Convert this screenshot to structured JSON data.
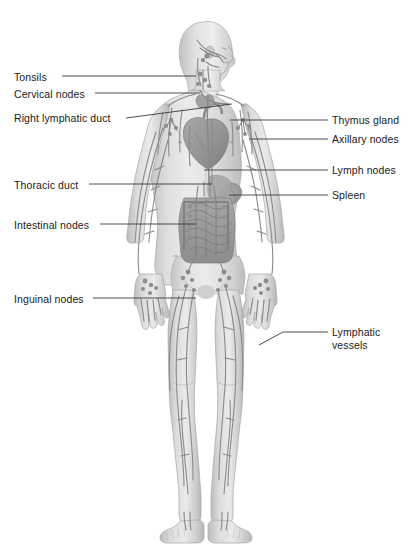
{
  "diagram": {
    "background_color": "#ffffff",
    "body_fill_color": "#d9d9d9",
    "body_shade_color": "#b3b3b3",
    "vessel_color": "#8a8a8a",
    "organ_color": "#9a9a9a",
    "label_color": "#1a1a1a",
    "leader_color": "#3a3a3a"
  },
  "labels_left": [
    {
      "id": "tonsils",
      "text": "Tonsils",
      "x": 14,
      "y": 71,
      "leader": {
        "x1": 62,
        "y1": 76,
        "x2": 196,
        "y2": 76
      }
    },
    {
      "id": "cervical-nodes",
      "text": "Cervical nodes",
      "x": 14,
      "y": 88,
      "leader": {
        "x1": 95,
        "y1": 93,
        "x2": 200,
        "y2": 93
      }
    },
    {
      "id": "right-lymphatic-duct",
      "text": "Right lymphatic duct",
      "x": 14,
      "y": 112,
      "leader": {
        "x1": 126,
        "y1": 118,
        "x2": 232,
        "y2": 104
      }
    },
    {
      "id": "thoracic-duct",
      "text": "Thoracic duct",
      "x": 14,
      "y": 179,
      "leader": {
        "x1": 89,
        "y1": 184,
        "x2": 212,
        "y2": 184
      }
    },
    {
      "id": "intestinal-nodes",
      "text": "Intestinal nodes",
      "x": 14,
      "y": 219,
      "leader": {
        "x1": 100,
        "y1": 224,
        "x2": 196,
        "y2": 224
      }
    },
    {
      "id": "inguinal-nodes",
      "text": "Inguinal nodes",
      "x": 14,
      "y": 293,
      "leader": {
        "x1": 93,
        "y1": 298,
        "x2": 196,
        "y2": 298
      }
    }
  ],
  "labels_right": [
    {
      "id": "thymus-gland",
      "text": "Thymus gland",
      "x": 332,
      "y": 114,
      "leader": {
        "x1": 283,
        "y1": 120,
        "x2": 230,
        "y2": 120
      }
    },
    {
      "id": "axillary-nodes",
      "text": "Axillary nodes",
      "x": 332,
      "y": 134,
      "leader": {
        "x1": 283,
        "y1": 139,
        "x2": 249,
        "y2": 139
      }
    },
    {
      "id": "lymph-nodes",
      "text": "Lymph nodes",
      "x": 332,
      "y": 165,
      "leader": {
        "x1": 283,
        "y1": 170,
        "x2": 204,
        "y2": 170
      }
    },
    {
      "id": "spleen",
      "text": "Spleen",
      "x": 332,
      "y": 190,
      "leader": {
        "x1": 283,
        "y1": 195,
        "x2": 229,
        "y2": 195
      }
    }
  ],
  "labels_right_multiline": [
    {
      "id": "lymphatic-vessels",
      "line1": "Lymphatic",
      "line2": "vessels",
      "x": 332,
      "y": 327,
      "leader": {
        "x1": 327,
        "y1": 332,
        "x2": 283,
        "y2": 332,
        "x3": 259,
        "y3": 345
      }
    }
  ]
}
